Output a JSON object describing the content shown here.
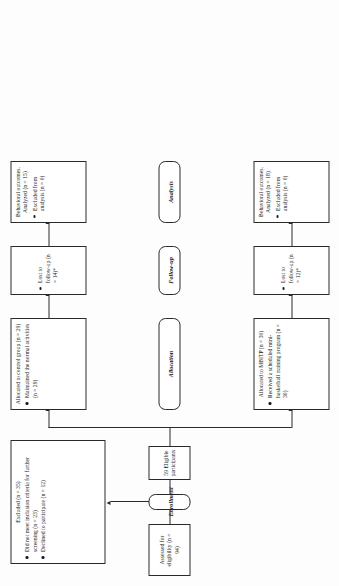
{
  "diagram": {
    "type": "consort-flow-diagram",
    "stage_labels": [
      {
        "id": "allocation",
        "label": "Allocation"
      },
      {
        "id": "followup",
        "label": "Follow-up"
      },
      {
        "id": "analysis",
        "label": "Analysis"
      }
    ],
    "enrollment": {
      "stage_label": "Enrollment",
      "assessed": "Assessed for eligibility (n = 94)",
      "eligible": "59 Eligible participants",
      "excluded": {
        "header": "Excluded (n = 35)",
        "reasons": [
          "Did not meet inclusion criteria for further screening (n = 23)",
          "Declined to participate (n = 12)"
        ]
      }
    },
    "arms": [
      {
        "id": "control",
        "allocation": {
          "header": "Allocated to control group (n = 29)",
          "items": [
            "Maintained the normal activities (n = 29)"
          ]
        },
        "followup": {
          "items": [
            "Lost to follow-up (n = 14)*"
          ]
        },
        "analysis": {
          "header": "Behavioral outcomes. Analyzed (n = 15)",
          "items": [
            "Excluded from analysis (n = 0)"
          ]
        }
      },
      {
        "id": "intervention",
        "allocation": {
          "header": "Allocated to MBITP (n = 30)",
          "items": [
            "Received a scheduled mini-basketball training program (n = 30)"
          ]
        },
        "followup": {
          "items": [
            "Lost to follow-up (n = 12)*"
          ]
        },
        "analysis": {
          "header": "Behavioral outcomes. Analyzed (n = 18)",
          "items": [
            "Excluded from analysis (n = 0)"
          ]
        }
      }
    ],
    "colors": {
      "border": "#2a2a2a",
      "text": "#1a1a1a",
      "background": "#ffffff"
    }
  }
}
